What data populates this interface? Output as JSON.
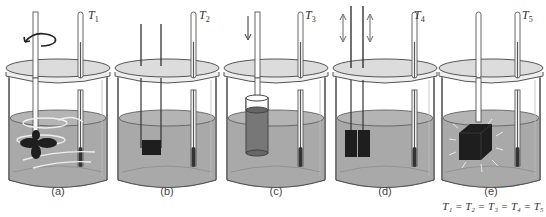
{
  "figure": {
    "colors": {
      "water": "#a9a9a9",
      "water_surface": "#b8b8b8",
      "lid": "#dcdcdc",
      "glass_outline": "#555555",
      "dark_object": "#1e1e1e",
      "background": "#ffffff"
    },
    "panels": [
      {
        "id": "a",
        "caption": "(a)",
        "thermometer_label": "T",
        "thermometer_sub": "1",
        "process": "paddle stirrer rotated",
        "icons": [
          "rotation-arrow-icon",
          "paddle-icon",
          "swirl-icon"
        ]
      },
      {
        "id": "b",
        "caption": "(b)",
        "thermometer_label": "T",
        "thermometer_sub": "2",
        "process": "electrical resistor heater",
        "icons": [
          "resistor-block-icon"
        ]
      },
      {
        "id": "c",
        "caption": "(c)",
        "thermometer_label": "T",
        "thermometer_sub": "3",
        "process": "piston compressing gas cylinder",
        "icons": [
          "down-arrow-icon",
          "cylinder-icon"
        ]
      },
      {
        "id": "d",
        "caption": "(d)",
        "thermometer_label": "T",
        "thermometer_sub": "4",
        "process": "two blocks rubbed together",
        "icons": [
          "up-down-arrow-icon",
          "friction-blocks-icon"
        ]
      },
      {
        "id": "e",
        "caption": "(e)",
        "thermometer_label": "T",
        "thermometer_sub": "5",
        "process": "hot block immersed (heat transfer)",
        "icons": [
          "hot-block-icon",
          "radiation-lines-icon"
        ]
      }
    ],
    "equation": {
      "terms": [
        "T₁",
        "T₂",
        "T₃",
        "T₄",
        "T₅"
      ],
      "text": "T₁ = T₂ = T₃ = T₄ = T₅"
    }
  }
}
